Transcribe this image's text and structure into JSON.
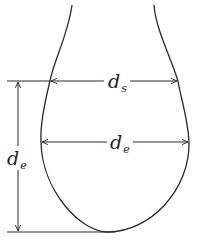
{
  "diagram": {
    "labels": {
      "ds_main": "d",
      "ds_sub": "s",
      "de_main": "d",
      "de_sub": "e",
      "height_main": "d",
      "height_sub": "e"
    },
    "colors": {
      "line": "#2a2a2a",
      "background": "#ffffff"
    }
  }
}
